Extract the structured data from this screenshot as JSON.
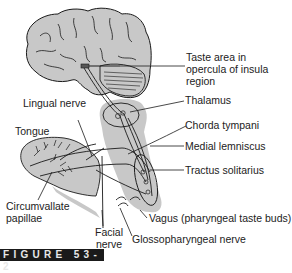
{
  "figure": {
    "label": "FIGURE 53-2"
  },
  "labels": {
    "taste_area": [
      "Taste area in",
      "opercula of insula",
      "region"
    ],
    "thalamus": "Thalamus",
    "chorda_tympani": "Chorda tympani",
    "medial_lemniscus": "Medial lemniscus",
    "tractus_solitarius": "Tractus solitarius",
    "vagus": "Vagus (pharyngeal taste buds)",
    "glossopharyngeal": "Glossopharyngeal nerve",
    "facial": [
      "Facial",
      "nerve"
    ],
    "lingual": "Lingual nerve",
    "tongue": "Tongue",
    "circumvallate": [
      "Circumvallate",
      "papillae"
    ]
  },
  "colors": {
    "fill": "#c8c8c8",
    "stroke": "#1a1a1a",
    "background": "#ffffff"
  }
}
